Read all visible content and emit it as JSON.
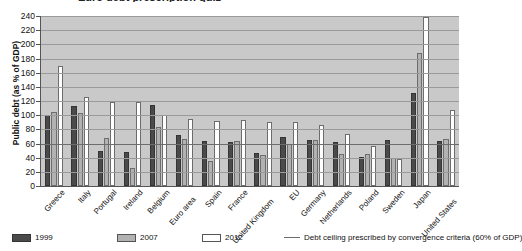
{
  "chart_data": {
    "type": "bar",
    "title": "Euro debt prescription quiz",
    "ylabel": "Public debt (as % of GDP)",
    "xlabel": "",
    "ylim": [
      0,
      240
    ],
    "ytick_step": 20,
    "yticks": [
      "0",
      "20",
      "40",
      "60",
      "80",
      "100",
      "120",
      "140",
      "160",
      "180",
      "200",
      "220",
      "240"
    ],
    "grid": true,
    "legend_position": "bottom",
    "categories": [
      "Greece",
      "Italy",
      "Portugal",
      "Ireland",
      "Belgium",
      "Euro area",
      "Spain",
      "France",
      "United Kingdom",
      "EU",
      "Germany",
      "Netherlands",
      "Poland",
      "Sweden",
      "Japan",
      "United States"
    ],
    "series": [
      {
        "name": "1999",
        "color": "#4a4a4a",
        "values": [
          100,
          113,
          50,
          48,
          114,
          72,
          64,
          62,
          46,
          69,
          65,
          62,
          41,
          65,
          131,
          64
        ]
      },
      {
        "name": "2007",
        "color": "#b2b2b2",
        "values": [
          105,
          103,
          68,
          25,
          84,
          66,
          36,
          64,
          44,
          59,
          65,
          45,
          45,
          40,
          188,
          67
        ]
      },
      {
        "name": "2012",
        "color": "#ffffff",
        "values": [
          170,
          125,
          119,
          118,
          100,
          95,
          92,
          93,
          91,
          90,
          86,
          73,
          57,
          38,
          238,
          107
        ]
      }
    ],
    "annotations": [
      {
        "name": "debt-ceiling",
        "value": 60,
        "label": "Debt ceiling prescribed by convergence criteria (60% of GDP)",
        "color": "#6d6d6d"
      }
    ]
  },
  "legend": {
    "items": [
      {
        "label": "1999",
        "kind": "swatch",
        "series": "1999"
      },
      {
        "label": "2007",
        "kind": "swatch",
        "series": "2007"
      },
      {
        "label": "2012",
        "kind": "swatch",
        "series": "2012"
      },
      {
        "label": "Debt ceiling prescribed by convergence criteria (60% of GDP)",
        "kind": "line"
      }
    ]
  }
}
